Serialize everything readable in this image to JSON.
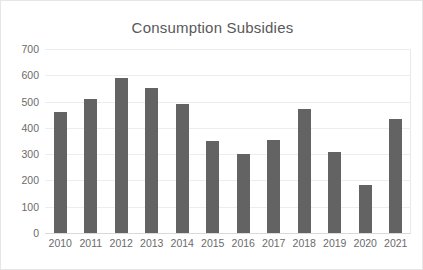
{
  "chart_data": {
    "type": "bar",
    "title": "Consumption Subsidies",
    "xlabel": "",
    "ylabel": "",
    "categories": [
      "2010",
      "2011",
      "2012",
      "2013",
      "2014",
      "2015",
      "2016",
      "2017",
      "2018",
      "2019",
      "2020",
      "2021"
    ],
    "values": [
      460,
      510,
      588,
      550,
      490,
      350,
      300,
      355,
      470,
      310,
      182,
      435
    ],
    "ylim": [
      0,
      700
    ],
    "yticks": [
      0,
      100,
      200,
      300,
      400,
      500,
      600,
      700
    ],
    "ytick_labels": [
      "0",
      "100",
      "200",
      "300",
      "400",
      "500",
      "600",
      "700"
    ],
    "grid": true,
    "legend": false,
    "legend_position": "none",
    "bar_color": "#636363",
    "gridline_color": "#ededed",
    "title_color": "#595959",
    "tick_label_color": "#6b6b6b",
    "plot_background": "#ffffff",
    "border_color": "#e6e6e6"
  }
}
